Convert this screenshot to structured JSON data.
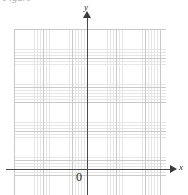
{
  "figure": {
    "caption_fragment": "Figure",
    "origin_label": "0",
    "width_px": 188,
    "height_px": 195,
    "background_color": "#ffffff"
  },
  "axes": {
    "x": {
      "label": "x",
      "arrow_direction": "right",
      "color": "#4a4a4a"
    },
    "y": {
      "label": "y",
      "arrow_direction": "up",
      "color": "#4a4a4a"
    }
  },
  "grid": {
    "major_spacing_px": 14.6,
    "minor_spacing_px": 2.92,
    "major_color": "#c9c9c9",
    "minor_color": "#e6e6e6"
  },
  "chart_data": {
    "type": "scatter",
    "title": "",
    "subtitle": "",
    "xlabel": "x",
    "ylabel": "y",
    "series": [
      {
        "name": "",
        "x": [],
        "y": []
      }
    ],
    "x": [],
    "values": [],
    "categories": [],
    "xlim": [
      -5,
      5.4
    ],
    "ylim": [
      -1.8,
      9.6
    ],
    "xticks": [],
    "yticks": [],
    "xticklabels": [],
    "yticklabels": [],
    "annotations": [
      {
        "text": "0",
        "x": 0,
        "y": 0,
        "note": "origin label placed below-left of axis intersection"
      }
    ],
    "grid": true,
    "grid_style": "graph-paper, major lines every 1 unit with 5 minor subdivisions",
    "legend": false,
    "legend_position": "none",
    "axis_arrows": true
  }
}
